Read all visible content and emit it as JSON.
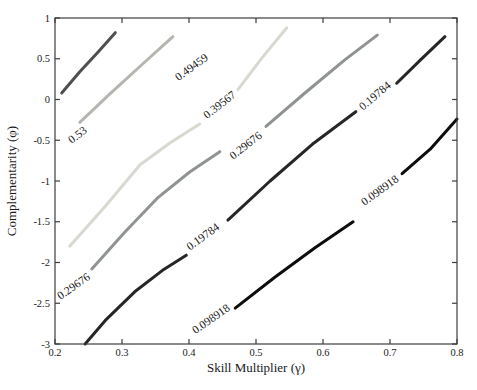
{
  "figure": {
    "title": "",
    "xlabel": "Skill Multiplier (γ)",
    "ylabel": "Complementarity (φ)"
  },
  "chart_data": {
    "type": "contour",
    "title": "",
    "xlabel": "Skill Multiplier (γ)",
    "ylabel": "Complementarity (φ)",
    "xlim": [
      0.2,
      0.8
    ],
    "ylim": [
      -3,
      1
    ],
    "grid": false,
    "x_ticks": [
      "0.2",
      "0.3",
      "0.4",
      "0.5",
      "0.6",
      "0.7",
      "0.8"
    ],
    "y_ticks": [
      "1",
      "0.5",
      "0",
      "-0.5",
      "-1",
      "-1.5",
      "-2",
      "-2.5",
      "-3"
    ],
    "axis_color": "#3c3c3c",
    "text_color": "#1a1a1a",
    "contour_levels": [
      0.098918,
      0.19784,
      0.29676,
      0.39567,
      0.49459,
      0.53
    ],
    "contours": [
      {
        "level": 0.53,
        "label": "0.53",
        "color": "#4f4f4d",
        "segments": [
          [
            [
              0.21,
              0.08
            ],
            [
              0.237,
              0.34
            ],
            [
              0.264,
              0.58
            ],
            [
              0.29,
              0.82
            ]
          ]
        ],
        "labels": [
          {
            "x": 0.237,
            "y": -0.47,
            "rot": -38
          }
        ]
      },
      {
        "level": 0.49459,
        "label": "0.49459",
        "color": "#b3b7af",
        "segments": [
          [
            [
              0.237,
              -0.28
            ],
            [
              0.282,
              0.07
            ],
            [
              0.334,
              0.46
            ],
            [
              0.376,
              0.77
            ]
          ]
        ],
        "labels": [
          {
            "x": 0.407,
            "y": 0.36,
            "rot": -36
          }
        ]
      },
      {
        "level": 0.39567,
        "label": "0.39567",
        "color": "#d8d9d1",
        "segments": [
          [
            [
              0.222,
              -1.8
            ],
            [
              0.275,
              -1.31
            ],
            [
              0.327,
              -0.8
            ],
            [
              0.372,
              -0.53
            ],
            [
              0.416,
              -0.3
            ]
          ],
          [
            [
              0.473,
              0.12
            ],
            [
              0.509,
              0.51
            ],
            [
              0.546,
              0.88
            ]
          ]
        ],
        "labels": [
          {
            "x": 0.449,
            "y": -0.1,
            "rot": -38
          }
        ]
      },
      {
        "level": 0.29676,
        "label": "0.29676",
        "color": "#8f9491",
        "segments": [
          [
            [
              0.255,
              -2.08
            ],
            [
              0.304,
              -1.63
            ],
            [
              0.354,
              -1.2
            ],
            [
              0.401,
              -0.89
            ],
            [
              0.446,
              -0.64
            ]
          ],
          [
            [
              0.515,
              -0.33
            ],
            [
              0.573,
              0.08
            ],
            [
              0.633,
              0.49
            ],
            [
              0.681,
              0.79
            ]
          ]
        ],
        "labels": [
          {
            "x": 0.231,
            "y": -2.33,
            "rot": -35
          },
          {
            "x": 0.488,
            "y": -0.6,
            "rot": -38
          }
        ]
      },
      {
        "level": 0.19784,
        "label": "0.19784",
        "color": "#262624",
        "segments": [
          [
            [
              0.245,
              -3.0
            ],
            [
              0.275,
              -2.71
            ],
            [
              0.319,
              -2.36
            ],
            [
              0.36,
              -2.1
            ],
            [
              0.396,
              -1.91
            ]
          ],
          [
            [
              0.458,
              -1.48
            ],
            [
              0.521,
              -1.0
            ],
            [
              0.584,
              -0.55
            ],
            [
              0.649,
              -0.15
            ]
          ],
          [
            [
              0.71,
              0.2
            ],
            [
              0.746,
              0.49
            ],
            [
              0.782,
              0.77
            ]
          ]
        ],
        "labels": [
          {
            "x": 0.424,
            "y": -1.72,
            "rot": -36
          },
          {
            "x": 0.681,
            "y": 0.01,
            "rot": -40
          }
        ]
      },
      {
        "level": 0.098918,
        "label": "0.098918",
        "color": "#0d0d0d",
        "segments": [
          [
            [
              0.469,
              -2.56
            ],
            [
              0.528,
              -2.18
            ],
            [
              0.588,
              -1.82
            ],
            [
              0.645,
              -1.5
            ]
          ],
          [
            [
              0.718,
              -0.91
            ],
            [
              0.76,
              -0.61
            ],
            [
              0.8,
              -0.24
            ]
          ]
        ],
        "labels": [
          {
            "x": 0.436,
            "y": -2.73,
            "rot": -35
          },
          {
            "x": 0.688,
            "y": -1.15,
            "rot": -36
          }
        ]
      }
    ]
  }
}
